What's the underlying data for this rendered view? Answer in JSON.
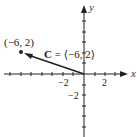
{
  "diagram": {
    "type": "vector-plot",
    "axes": {
      "x_label": "x",
      "y_label": "y",
      "x_tick_labels": [
        "−2",
        "2"
      ],
      "y_tick_labels": [
        "−2"
      ]
    },
    "vector": {
      "name": "C",
      "components": [
        -6,
        2
      ],
      "label_name": "C",
      "label_eq": " = ⟨−6, 2⟩"
    },
    "point": {
      "coords": [
        -6,
        2
      ],
      "label": "(−6, 2)"
    },
    "colors": {
      "ink": "#222222"
    }
  }
}
